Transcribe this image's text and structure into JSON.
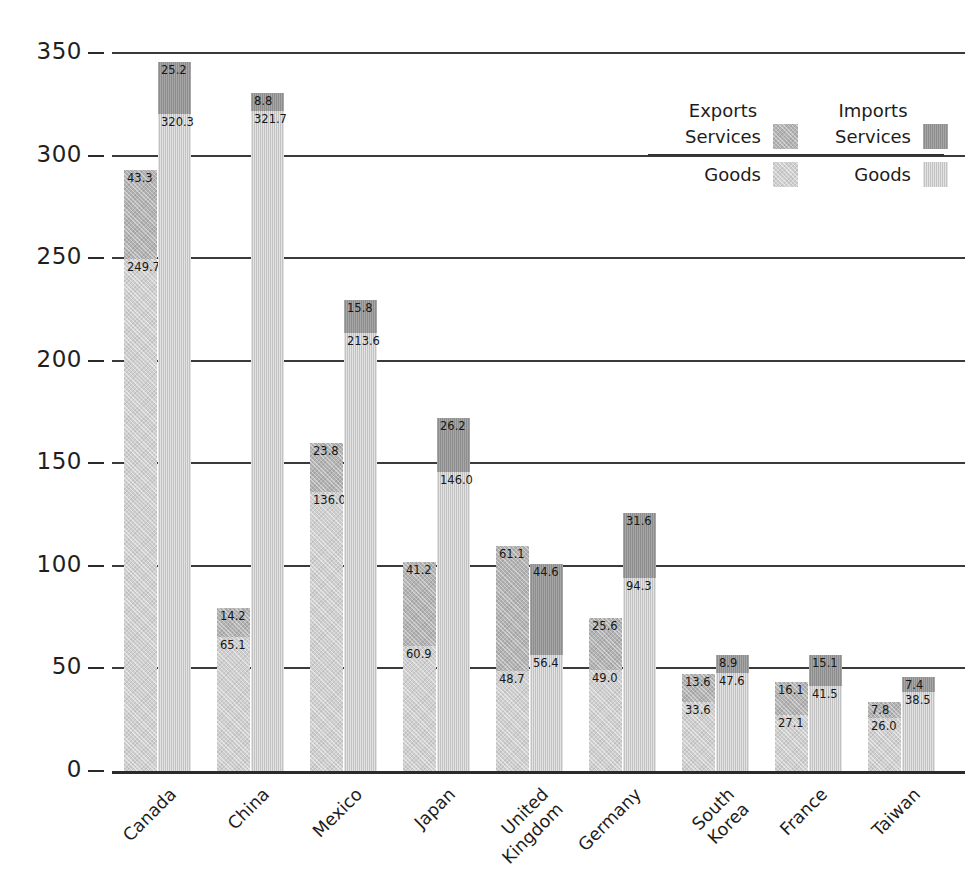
{
  "axis": {
    "ylabel": "Billions of dollars",
    "yticks": [
      "350",
      "300",
      "250",
      "200",
      "150",
      "100",
      "50",
      "0"
    ]
  },
  "legend": {
    "exports_header": "Exports",
    "imports_header": "Imports",
    "export_services_label": "Services",
    "import_services_label": "Services",
    "export_goods_label": "Goods",
    "import_goods_label": "Goods",
    "colors": {
      "export_services": "#b3b3b3",
      "export_goods": "#cfcfcf",
      "import_services": "#8d8d8d",
      "import_goods": "#c2c2c2"
    }
  },
  "chart_data": {
    "type": "bar",
    "title": "",
    "xlabel": "",
    "ylabel": "Billions of dollars",
    "ylim": [
      0,
      350
    ],
    "ytick_step": 50,
    "grid": true,
    "stacked": true,
    "grouped": true,
    "legend_position": "upper-right",
    "categories": [
      "Canada",
      "China",
      "Mexico",
      "Japan",
      "United Kingdom",
      "South Korea",
      "Germany",
      "France",
      "Taiwan"
    ],
    "category_labels": [
      "Canada",
      "China",
      "Mexico",
      "Japan",
      "United\nKingdom",
      "Germany",
      "South\nKorea",
      "France",
      "Taiwan"
    ],
    "series": [
      {
        "name": "Exports Goods",
        "values": [
          249.7,
          65.1,
          136.0,
          60.9,
          48.7,
          49.0,
          33.6,
          27.1,
          26.0
        ]
      },
      {
        "name": "Exports Services",
        "values": [
          43.3,
          14.2,
          23.8,
          41.2,
          61.1,
          25.6,
          13.6,
          16.1,
          7.8
        ]
      },
      {
        "name": "Imports Goods",
        "values": [
          320.3,
          321.7,
          213.6,
          146.0,
          56.4,
          94.3,
          47.6,
          41.5,
          38.5
        ]
      },
      {
        "name": "Imports Services",
        "values": [
          25.2,
          8.8,
          15.8,
          26.2,
          44.6,
          31.6,
          8.9,
          15.1,
          7.4
        ]
      }
    ],
    "groups": [
      {
        "label": "Canada",
        "label_display": "Canada",
        "exports": {
          "goods": 249.7,
          "services": 43.3
        },
        "imports": {
          "goods": 320.3,
          "services": 25.2
        }
      },
      {
        "label": "China",
        "label_display": "China",
        "exports": {
          "goods": 65.1,
          "services": 14.2
        },
        "imports": {
          "goods": 321.7,
          "services": 8.8
        }
      },
      {
        "label": "Mexico",
        "label_display": "Mexico",
        "exports": {
          "goods": 136.0,
          "services": 23.8
        },
        "imports": {
          "goods": 213.6,
          "services": 15.8
        }
      },
      {
        "label": "Japan",
        "label_display": "Japan",
        "exports": {
          "goods": 60.9,
          "services": 41.2
        },
        "imports": {
          "goods": 146.0,
          "services": 26.2
        }
      },
      {
        "label": "United Kingdom",
        "label_display": "United\nKingdom",
        "exports": {
          "goods": 48.7,
          "services": 61.1
        },
        "imports": {
          "goods": 56.4,
          "services": 44.6
        }
      },
      {
        "label": "Germany",
        "label_display": "Germany",
        "exports": {
          "goods": 49.0,
          "services": 25.6
        },
        "imports": {
          "goods": 94.3,
          "services": 31.6
        }
      },
      {
        "label": "South Korea",
        "label_display": "South\nKorea",
        "exports": {
          "goods": 33.6,
          "services": 13.6
        },
        "imports": {
          "goods": 47.6,
          "services": 8.9
        }
      },
      {
        "label": "France",
        "label_display": "France",
        "exports": {
          "goods": 27.1,
          "services": 16.1
        },
        "imports": {
          "goods": 41.5,
          "services": 15.1
        }
      },
      {
        "label": "Taiwan",
        "label_display": "Taiwan",
        "exports": {
          "goods": 26.0,
          "services": 7.8
        },
        "imports": {
          "goods": 38.5,
          "services": 7.4
        }
      }
    ]
  }
}
